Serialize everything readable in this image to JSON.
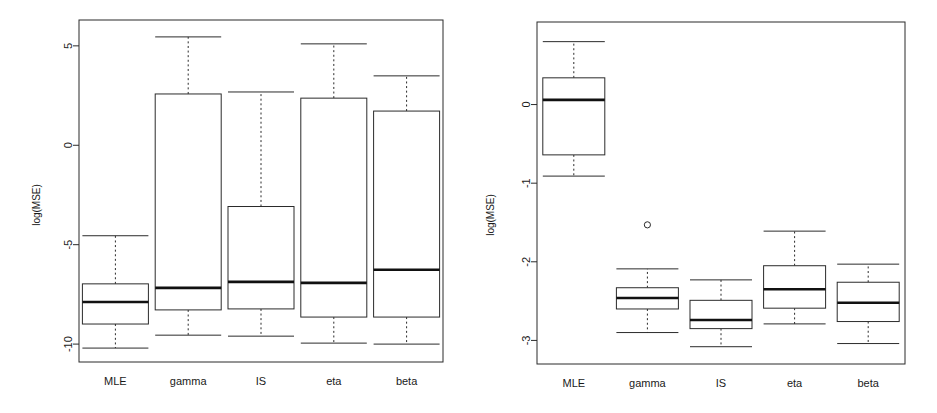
{
  "figure": {
    "background": "#ffffff",
    "ink_color": "#2b2b2b",
    "panel_count": 2
  },
  "chart_data": [
    {
      "type": "box",
      "panel": "left",
      "title": "",
      "xlabel": "",
      "ylabel": "log(MSE)",
      "categories": [
        "MLE",
        "gamma",
        "IS",
        "eta",
        "beta"
      ],
      "yticks": [
        5,
        0,
        -5,
        -10
      ],
      "ytick_labels": [
        "5",
        "0",
        "-5",
        "-10"
      ],
      "ylim": [
        -10.9,
        6.3
      ],
      "grid": false,
      "legend": "none",
      "boxes": [
        {
          "name": "MLE",
          "whisker_low": -10.2,
          "q1": -8.99,
          "median": -7.88,
          "q3": -6.97,
          "whisker_high": -4.55,
          "outliers": []
        },
        {
          "name": "gamma",
          "whisker_low": -9.55,
          "q1": -8.28,
          "median": -7.17,
          "q3": 2.58,
          "whisker_high": 5.45,
          "outliers": []
        },
        {
          "name": "IS",
          "whisker_low": -9.6,
          "q1": -8.23,
          "median": -6.87,
          "q3": -3.08,
          "whisker_high": 2.68,
          "outliers": []
        },
        {
          "name": "eta",
          "whisker_low": -9.95,
          "q1": -8.64,
          "median": -6.92,
          "q3": 2.37,
          "whisker_high": 5.1,
          "outliers": []
        },
        {
          "name": "beta",
          "whisker_low": -10.0,
          "q1": -8.64,
          "median": -6.26,
          "q3": 1.72,
          "whisker_high": 3.49,
          "outliers": []
        }
      ]
    },
    {
      "type": "box",
      "panel": "right",
      "title": "",
      "xlabel": "",
      "ylabel": "log(MSE)",
      "categories": [
        "MLE",
        "gamma",
        "IS",
        "eta",
        "beta"
      ],
      "yticks": [
        0,
        -1,
        -2,
        -3
      ],
      "ytick_labels": [
        "0",
        "-1",
        "-2",
        "-3"
      ],
      "ylim": [
        -3.3,
        1.05
      ],
      "grid": false,
      "legend": "none",
      "boxes": [
        {
          "name": "MLE",
          "whisker_low": -0.91,
          "q1": -0.64,
          "median": 0.06,
          "q3": 0.34,
          "whisker_high": 0.8,
          "outliers": []
        },
        {
          "name": "gamma",
          "whisker_low": -2.9,
          "q1": -2.6,
          "median": -2.46,
          "q3": -2.33,
          "whisker_high": -2.09,
          "outliers": [
            -1.53
          ]
        },
        {
          "name": "IS",
          "whisker_low": -3.08,
          "q1": -2.85,
          "median": -2.74,
          "q3": -2.49,
          "whisker_high": -2.23,
          "outliers": []
        },
        {
          "name": "eta",
          "whisker_low": -2.79,
          "q1": -2.59,
          "median": -2.35,
          "q3": -2.05,
          "whisker_high": -1.61,
          "outliers": []
        },
        {
          "name": "beta",
          "whisker_low": -3.04,
          "q1": -2.76,
          "median": -2.52,
          "q3": -2.26,
          "whisker_high": -2.03,
          "outliers": []
        }
      ]
    }
  ],
  "panels": {
    "left": {
      "ylabel": "log(MSE)",
      "ytick_labels": [
        "5",
        "0",
        "-5",
        "-10"
      ],
      "categories": [
        "MLE",
        "gamma",
        "IS",
        "eta",
        "beta"
      ]
    },
    "right": {
      "ylabel": "log(MSE)",
      "ytick_labels": [
        "0",
        "-1",
        "-2",
        "-3"
      ],
      "categories": [
        "MLE",
        "gamma",
        "IS",
        "eta",
        "beta"
      ]
    }
  }
}
